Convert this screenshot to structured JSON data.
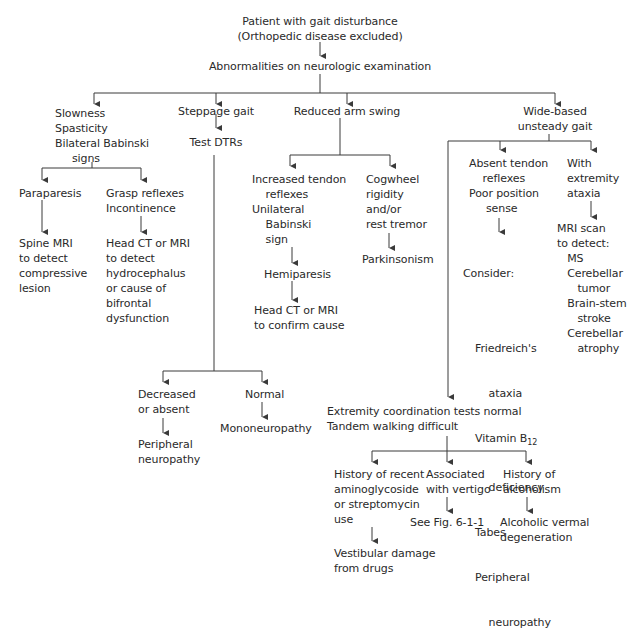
{
  "nodes": {
    "root": "Patient with gait disturbance\n(Orthopedic disease excluded)",
    "abnormal": "Abnormalities on neurologic examination",
    "slowness": "Slowness\nSpasticity\nBilateral Babinski\n     signs",
    "steppage": "Steppage gait",
    "test_dtrs": "Test DTRs",
    "reduced_arm": "Reduced arm swing",
    "wide_based": "Wide-based\nunsteady gait",
    "paraparesis": "Paraparesis",
    "spine_mri": "Spine MRI\nto detect\ncompressive\nlesion",
    "grasp": "Grasp reflexes\nIncontinence",
    "head_ct_hydro": "Head CT or MRI\nto detect\nhydrocephalus\nor cause of\nbifrontal\ndysfunction",
    "increased_tendon": "Increased tendon\n    reflexes\nUnilateral\n    Babinski\n    sign",
    "hemiparesis": "Hemiparesis",
    "head_ct_confirm": "Head CT or MRI\nto confirm cause",
    "cogwheel": "Cogwheel\nrigidity\nand/or\nrest tremor",
    "parkinsonism": "Parkinsonism",
    "absent_tendon": "Absent tendon\n    reflexes\nPoor position\n     sense",
    "consider_title": "Consider:",
    "consider_items": [
      "Friedreich's",
      "    ataxia",
      "Vitamin B",
      "    deficiency",
      "Tabes",
      "Peripheral",
      "    neuropathy"
    ],
    "vitamin_sub": "12",
    "extremity_ataxia": "With\nextremity\nataxia",
    "mri_scan": "MRI scan\nto detect:\n   MS\n   Cerebellar\n      tumor\n   Brain-stem\n      stroke\n   Cerebellar\n      atrophy",
    "decreased": "Decreased\nor absent",
    "peripheral_neuro": "Peripheral\nneuropathy",
    "normal": "Normal",
    "mononeuropathy": "Mononeuropathy",
    "coord_normal": "Extremity coordination tests normal\nTandem walking difficult",
    "aminoglycoside": "History of recent\naminoglycoside\nor streptomycin\nuse",
    "vestibular": "Vestibular damage\nfrom drugs",
    "vertigo": "Associated\nwith vertigo",
    "see_fig": "See Fig. 6-1-1",
    "alcoholism": "History of\nalcoholism",
    "alcoholic_vermal": "Alcoholic vermal\ndegeneration"
  },
  "style": {
    "line_color": "#3a3a3a",
    "text_color": "#2a2a2a"
  }
}
